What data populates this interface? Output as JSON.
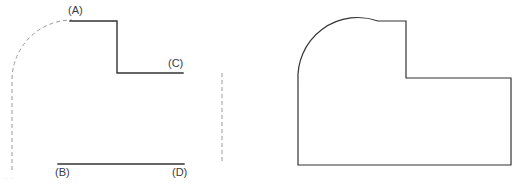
{
  "figure": {
    "colors": {
      "solid_line": "#333333",
      "construction_line": "#9a9a9a",
      "label_text": "#3a3a3a",
      "background": "#ffffff"
    },
    "left_view": {
      "name": "stepped-profile-with-construction-arc",
      "labels": {
        "a": "(A)",
        "b": "(B)",
        "c": "(C)",
        "d": "(D)"
      },
      "construction_arc": {
        "style": "dashed",
        "start_point": [
          12,
          170
        ],
        "end_point": [
          72,
          20
        ],
        "corner_point": [
          12,
          20
        ],
        "radius": 60
      },
      "solid_polyline": {
        "points": [
          [
            70,
            21
          ],
          [
            117,
            21
          ],
          [
            117,
            73
          ],
          [
            183,
            73
          ]
        ]
      },
      "baseline_segment": {
        "points": [
          [
            58,
            164
          ],
          [
            184,
            164
          ]
        ]
      },
      "construction_vertical": {
        "style": "dashed",
        "points": [
          [
            222,
            73
          ],
          [
            222,
            163
          ]
        ]
      }
    },
    "right_view": {
      "name": "closed-outline-rounded-corner",
      "outline": {
        "bottom_left": [
          298,
          165
        ],
        "left_top": [
          298,
          82
        ],
        "arc_end_top": [
          378,
          21
        ],
        "arc_radius": 60,
        "top_right_of_step": [
          406,
          21
        ],
        "step_bottom": [
          406,
          78
        ],
        "right_top": [
          511,
          78
        ],
        "bottom_right": [
          511,
          165
        ]
      }
    },
    "scan_artifact": "-- -"
  }
}
